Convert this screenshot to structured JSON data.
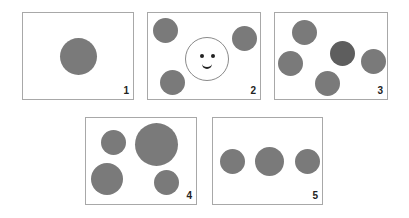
{
  "panels": [
    {
      "label": "1"
    },
    {
      "label": "2"
    },
    {
      "label": "3"
    },
    {
      "label": "4"
    },
    {
      "label": "5"
    }
  ],
  "colors": {
    "circle": "#7a7a7a",
    "circle_dark": "#5e5e5e",
    "frame": "#a8a8a8",
    "face_outline": "#8a8a8a"
  }
}
